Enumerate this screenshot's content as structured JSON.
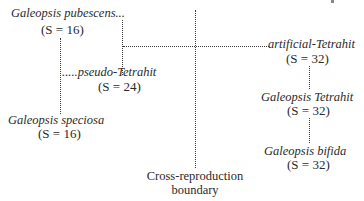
{
  "diagram": {
    "nodes": {
      "pubescens": {
        "name": "Galeopsis pubescens...",
        "chromosomes": "(S = 16)"
      },
      "pseudo_tetrahit": {
        "name": ".....pseudo-Tetrahit",
        "chromosomes": "(S = 24)"
      },
      "speciosa": {
        "name": "Galeopsis speciosa",
        "chromosomes": "(S = 16)"
      },
      "artificial_tetrahit": {
        "name": "artificial-Tetrahit",
        "chromosomes": "(S = 32)"
      },
      "tetrahit": {
        "name": "Galeopsis Tetrahit",
        "chromosomes": "(S = 32)"
      },
      "bifida": {
        "name": "Galeopsis bifida",
        "chromosomes": "(S = 32)"
      }
    },
    "boundary": {
      "line1": "Cross-reproduction",
      "line2": "boundary"
    },
    "line_color": "#3a3a3a",
    "text_color": "#2a2a2a",
    "edges": [
      {
        "from": "pubescens",
        "to": "speciosa",
        "style": "dotted"
      },
      {
        "from": "speciosa",
        "to": "pseudo_tetrahit",
        "style": "dotted"
      },
      {
        "from": "pubescens",
        "to": "artificial_tetrahit",
        "style": "dotted"
      },
      {
        "from": "artificial_tetrahit",
        "to": "tetrahit",
        "style": "dotted"
      },
      {
        "from": "tetrahit",
        "to": "bifida",
        "style": "dotted"
      }
    ]
  }
}
